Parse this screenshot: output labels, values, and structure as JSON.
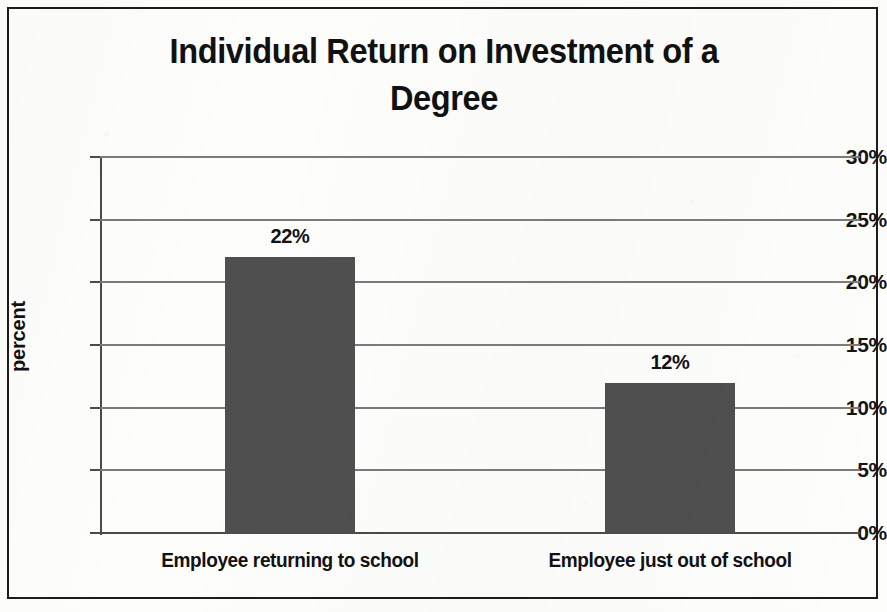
{
  "chart_data": {
    "type": "bar",
    "title": "Individual Return on Investment of a\nDegree",
    "title_line1": "Individual Return on Investment of a",
    "title_line2": "Degree",
    "xlabel": "",
    "ylabel": "percent",
    "categories": [
      "Employee returning to school",
      "Employee just out of school"
    ],
    "values": [
      22,
      12
    ],
    "value_labels": [
      "22%",
      "12%"
    ],
    "ylim": [
      0,
      30
    ],
    "ytick_values": [
      0,
      5,
      10,
      15,
      20,
      25,
      30
    ],
    "ytick_labels": [
      "0%",
      "5%",
      "10%",
      "15%",
      "20%",
      "25%",
      "30%"
    ],
    "grid": true,
    "legend": false,
    "legend_position": "none",
    "series": [
      {
        "name": "percent",
        "values": [
          22,
          12
        ],
        "color": "#4f4f4f"
      }
    ]
  },
  "style": {
    "bar_color": "#4f4f4f",
    "gridline_color": "#7b7b7b",
    "axis_color": "#4a4a4a",
    "text_color": "#111111",
    "frame_color": "#1c1c1c",
    "background": "#fdfdfc"
  }
}
